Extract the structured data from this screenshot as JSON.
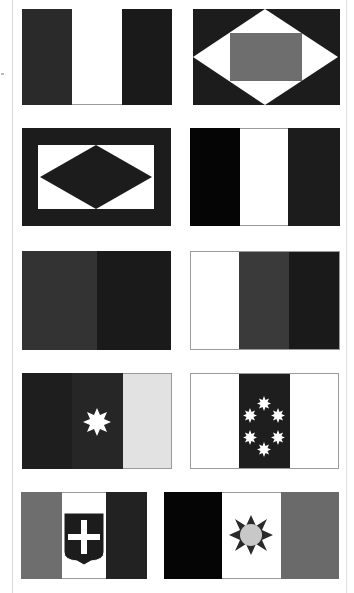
{
  "page": {
    "background": "#ffffff"
  },
  "colors": {
    "black": "#0a0a0a",
    "near_black": "#1c1c1c",
    "dark_gray": "#2e2e2e",
    "mid_dark": "#3a3a3a",
    "gray": "#6e6e6e",
    "light_gray": "#d8d8d8",
    "disc_gray": "#c8c8c8",
    "white": "#ffffff",
    "outline": "#9a9a9a"
  },
  "flags": [
    {
      "id": "flag-1",
      "design": "vertical-tricolor",
      "stripes": [
        "#2a2a2a",
        "#ffffff",
        "#1a1a1a"
      ],
      "emblem": null
    },
    {
      "id": "flag-2",
      "design": "black-field-white-diamond-gray-rectangle",
      "emblem": "gray-rectangle"
    },
    {
      "id": "flag-3",
      "design": "black-border-white-field-black-diamond",
      "emblem": "black-diamond"
    },
    {
      "id": "flag-4",
      "design": "vertical-tricolor",
      "stripes": [
        "#050505",
        "#ffffff",
        "#1c1c1c"
      ],
      "emblem": null
    },
    {
      "id": "flag-5",
      "design": "vertical-bicolor",
      "stripes": [
        "#333333",
        "#1a1a1a"
      ],
      "emblem": null
    },
    {
      "id": "flag-6",
      "design": "vertical-tricolor",
      "stripes": [
        "#ffffff",
        "#3a3a3a",
        "#1a1a1a"
      ],
      "emblem": null
    },
    {
      "id": "flag-7",
      "design": "vertical-tricolor-with-star",
      "stripes": [
        "#1e1e1e",
        "#262626",
        "#e2e2e2"
      ],
      "emblem": "white-eight-pointed-star"
    },
    {
      "id": "flag-8",
      "design": "vertical-tricolor-with-six-stars",
      "stripes": [
        "#ffffff",
        "#1e1e1e",
        "#ffffff"
      ],
      "emblem": "six-white-stars-in-ring"
    },
    {
      "id": "flag-9",
      "design": "vertical-tricolor-with-shield",
      "stripes": [
        "#6e6e6e",
        "#ffffff",
        "#222222"
      ],
      "emblem": "black-shield-white-cross"
    },
    {
      "id": "flag-10",
      "design": "vertical-tricolor-with-sun",
      "stripes": [
        "#050505",
        "#ffffff",
        "#6a6a6a"
      ],
      "emblem": "black-sun-gray-disc"
    }
  ]
}
